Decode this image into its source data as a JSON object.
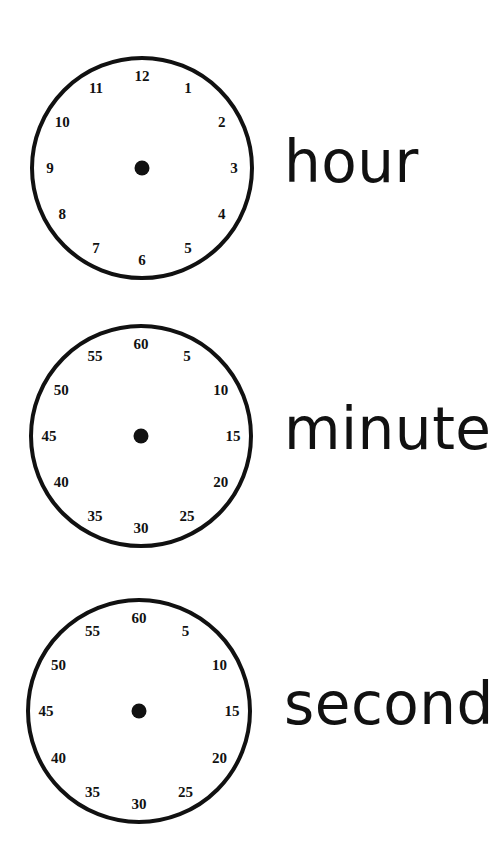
{
  "clocks": [
    {
      "id": "hour",
      "label": "hour",
      "cx": 142,
      "cy": 168,
      "r": 110,
      "numbers": [
        "12",
        "1",
        "2",
        "3",
        "4",
        "5",
        "6",
        "7",
        "8",
        "9",
        "10",
        "11"
      ]
    },
    {
      "id": "minute",
      "label": "minute",
      "cx": 141,
      "cy": 436,
      "r": 110,
      "numbers": [
        "60",
        "5",
        "10",
        "15",
        "20",
        "25",
        "30",
        "35",
        "40",
        "45",
        "50",
        "55"
      ]
    },
    {
      "id": "second",
      "label": "second",
      "cx": 139,
      "cy": 711,
      "r": 111,
      "numbers": [
        "60",
        "5",
        "10",
        "15",
        "20",
        "25",
        "30",
        "35",
        "40",
        "45",
        "50",
        "55"
      ]
    }
  ],
  "colors": {
    "ink": "#111111",
    "background": "#ffffff"
  }
}
